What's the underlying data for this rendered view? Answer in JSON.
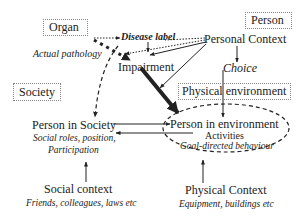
{
  "diagram": {
    "boxes": {
      "organ": "Organ",
      "person": "Person",
      "society": "Society",
      "physical_environment": "Physical environment"
    },
    "nodes": {
      "actual_pathology": "Actual pathology",
      "disease_label": "Disease label",
      "personal_context": "Personal Context",
      "impairment": "Impairment",
      "choice": "Choice",
      "person_in_society": "Person in Society",
      "person_in_society_sub1": "Social roles, position,",
      "person_in_society_sub2": "Participation",
      "person_in_environment": "Person in environment",
      "activities": "Activities",
      "activities_sub": "Goal-directed behaviour",
      "social_context": "Social context",
      "social_context_sub": "Friends, colleagues, laws etc",
      "physical_context": "Physical Context",
      "physical_context_sub": "Equipment, buildings etc"
    },
    "colors": {
      "ink": "#222222",
      "box_border": "#888888",
      "background": "#ffffff"
    }
  }
}
